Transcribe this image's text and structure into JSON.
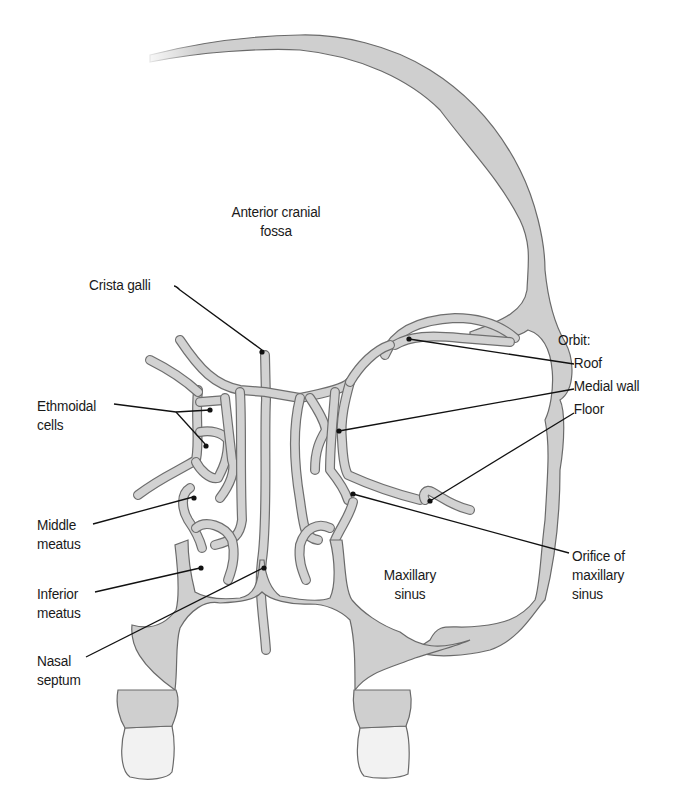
{
  "figure": {
    "colors": {
      "bone_fill": "#cfcfcf",
      "bone_outline": "#6a6a6a",
      "tooth_fill": "#f2f2f2",
      "leader_line": "#111111",
      "background": "#ffffff",
      "text": "#1a1a1a"
    }
  },
  "labels": {
    "anterior_cranial_fossa": {
      "line1": "Anterior cranial",
      "line2": "fossa"
    },
    "crista_galli": "Crista galli",
    "ethmoidal_cells": {
      "line1": "Ethmoidal",
      "line2": "cells"
    },
    "middle_meatus": {
      "line1": "Middle",
      "line2": "meatus"
    },
    "inferior_meatus": {
      "line1": "Inferior",
      "line2": "meatus"
    },
    "nasal_septum": {
      "line1": "Nasal",
      "line2": "septum"
    },
    "maxillary_sinus": {
      "line1": "Maxillary",
      "line2": "sinus"
    },
    "orbit": {
      "heading": "Orbit:",
      "roof": "Roof",
      "medial_wall": "Medial wall",
      "floor": "Floor"
    },
    "orifice_of_maxillary_sinus": {
      "line1": "Orifice of",
      "line2": "maxillary",
      "line3": "sinus"
    }
  }
}
